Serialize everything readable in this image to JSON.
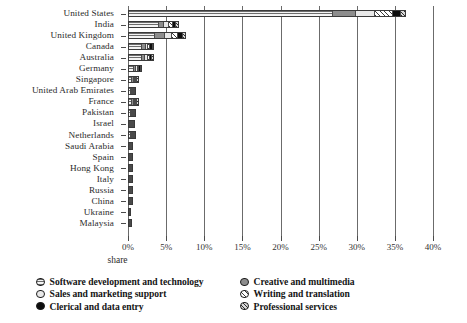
{
  "chart_data": {
    "type": "bar",
    "orientation": "horizontal",
    "stacked": true,
    "title": "",
    "xlabel": "share",
    "ylabel": "",
    "xlim": [
      0,
      40
    ],
    "xunit": "%",
    "grid": "vertical",
    "legend_position": "bottom",
    "xticks": [
      "0%",
      "5%",
      "10%",
      "15%",
      "20%",
      "25%",
      "30%",
      "35%",
      "40%"
    ],
    "xtick_values": [
      0,
      5,
      10,
      15,
      20,
      25,
      30,
      35,
      40
    ],
    "categories": [
      "United States",
      "India",
      "United Kingdom",
      "Canada",
      "Australia",
      "Germany",
      "Singapore",
      "United Arab Emirates",
      "France",
      "Pakistan",
      "Israel",
      "Netherlands",
      "Saudi Arabia",
      "Spain",
      "Hong Kong",
      "Italy",
      "Russia",
      "China",
      "Ukraine",
      "Malaysia"
    ],
    "series": [
      {
        "name": "Software development and technology",
        "marker": "horizontal-stripe-circle-icon",
        "values": [
          27.0,
          4.1,
          3.6,
          1.9,
          1.8,
          0.75,
          0.55,
          0.45,
          0.5,
          0.45,
          0.35,
          0.4,
          0.25,
          0.2,
          0.2,
          0.2,
          0.2,
          0.2,
          0.15,
          0.15
        ]
      },
      {
        "name": "Creative and multimedia",
        "marker": "gray-circle-icon",
        "values": [
          3.0,
          0.75,
          1.3,
          0.5,
          0.45,
          0.35,
          0.25,
          0.2,
          0.35,
          0.2,
          0.2,
          0.2,
          0.15,
          0.15,
          0.15,
          0.15,
          0.1,
          0.15,
          0.1,
          0.1
        ]
      },
      {
        "name": "Sales and marketing support",
        "marker": "white-circle-icon",
        "values": [
          2.5,
          0.55,
          0.9,
          0.35,
          0.4,
          0.25,
          0.2,
          0.15,
          0.2,
          0.15,
          0.15,
          0.2,
          0.1,
          0.1,
          0.1,
          0.1,
          0.1,
          0.1,
          0.05,
          0.08
        ]
      },
      {
        "name": "Writing and translation",
        "marker": "diagonal-hatch-circle-icon",
        "values": [
          2.4,
          0.6,
          0.85,
          0.3,
          0.3,
          0.2,
          0.15,
          0.1,
          0.15,
          0.1,
          0.12,
          0.15,
          0.08,
          0.08,
          0.08,
          0.08,
          0.08,
          0.1,
          0.05,
          0.05
        ]
      },
      {
        "name": "Clerical and data entry",
        "marker": "black-circle-icon",
        "values": [
          1.0,
          0.45,
          0.75,
          0.3,
          0.3,
          0.2,
          0.15,
          0.12,
          0.12,
          0.12,
          0.1,
          0.1,
          0.08,
          0.08,
          0.08,
          0.08,
          0.08,
          0.08,
          0.05,
          0.05
        ]
      },
      {
        "name": "Professional services",
        "marker": "cross-hatch-circle-icon",
        "values": [
          0.6,
          0.2,
          0.25,
          0.12,
          0.12,
          0.1,
          0.08,
          0.06,
          0.08,
          0.06,
          0.05,
          0.06,
          0.04,
          0.04,
          0.04,
          0.04,
          0.04,
          0.04,
          0.03,
          0.03
        ]
      }
    ],
    "totals": [
      36.5,
      6.65,
      7.65,
      3.46,
      3.37,
      1.85,
      1.38,
      1.08,
      1.4,
      1.08,
      0.97,
      1.11,
      0.7,
      0.65,
      0.65,
      0.65,
      0.6,
      0.67,
      0.43,
      0.46
    ]
  },
  "legend": {
    "column1": [
      "Software development and technology",
      "Sales and marketing support",
      "Clerical and data entry"
    ],
    "column2": [
      "Creative and multimedia",
      "Writing and translation",
      "Professional services"
    ]
  }
}
